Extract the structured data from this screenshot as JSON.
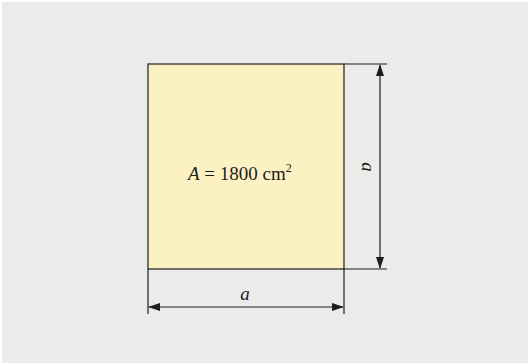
{
  "diagram": {
    "colors": {
      "background": "#ebebe9",
      "square_fill": "#fcf1c2",
      "line": "#1e1e1e"
    },
    "square": {
      "area_label_var": "A",
      "area_label_eq": " = 1800 cm",
      "area_label_exp": "2"
    },
    "dimensions": {
      "side_label_right": "a",
      "side_label_bottom": "a"
    }
  }
}
